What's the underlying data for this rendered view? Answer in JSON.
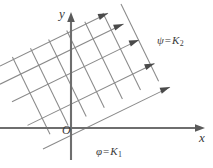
{
  "figure": {
    "type": "orthogonal-curvilinear-coordinate-grid",
    "background_color": "#ffffff",
    "axes": {
      "x_label": "x",
      "y_label": "y",
      "origin_label": "O",
      "axis_color": "#6e6e6e",
      "origin_px": {
        "x": 71,
        "y": 128
      },
      "x_axis_from_px": {
        "x": 0,
        "y": 128
      },
      "x_axis_to_px": {
        "x": 205,
        "y": 128
      },
      "y_axis_from_px": {
        "x": 71,
        "y": 160
      },
      "y_axis_to_px": {
        "x": 71,
        "y": 14
      }
    },
    "labels": {
      "psi": {
        "symbol": "ψ",
        "operator": "=",
        "constant": "K",
        "subscript": "2",
        "text": "ψ = K₂"
      },
      "phi": {
        "symbol": "φ",
        "operator": "=",
        "constant": "K",
        "subscript": "1",
        "text": "φ = K₁"
      }
    },
    "grid": {
      "line_color": "#8a8a8a",
      "arrow_color": "#4a4a4a",
      "psi_family": {
        "name": "psi-family",
        "description": "parallel straight lines with arrowheads pointing up-and-right",
        "direction_deg": 26,
        "count": 5,
        "has_arrowheads": true
      },
      "phi_family": {
        "name": "phi-family",
        "description": "parallel straight lines perpendicular to psi family, running down-and-right",
        "direction_deg": -64,
        "count": 7,
        "has_arrowheads": false
      }
    }
  }
}
